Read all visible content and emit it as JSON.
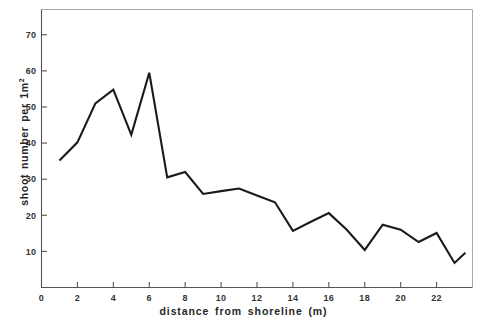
{
  "figure": {
    "background_color": "#ffffff",
    "line_color": "#1a1a1a",
    "axis_color": "#545454",
    "frame_color": "#a9a9a9"
  },
  "chart_data": {
    "type": "line",
    "title": "",
    "subtitle": "",
    "xlabel": "distance from shoreline (m)",
    "ylabel": "shoot number per 1m2",
    "ylabel_base": "shoot number per 1m",
    "ylabel_exponent": "2",
    "xlim": [
      0,
      24
    ],
    "ylim": [
      0,
      77
    ],
    "xticks": [
      0,
      2,
      4,
      6,
      8,
      10,
      12,
      14,
      16,
      18,
      20,
      22
    ],
    "xtick_labels": [
      "0",
      "2",
      "4",
      "6",
      "8",
      "10",
      "12",
      "14",
      "16",
      "18",
      "20",
      "22"
    ],
    "yticks": [
      10,
      20,
      30,
      40,
      50,
      60,
      70
    ],
    "ytick_labels": [
      "10",
      "20",
      "30",
      "40",
      "50",
      "60",
      "70"
    ],
    "grid": false,
    "legend": false,
    "legend_position": "none",
    "x": [
      1,
      2,
      3,
      4,
      5,
      6,
      7,
      8,
      9,
      10,
      11,
      12,
      13,
      14,
      15,
      16,
      17,
      18,
      19,
      20,
      21,
      22,
      23,
      23.6
    ],
    "y": [
      35.2,
      40.2,
      51.0,
      54.8,
      42.3,
      59.5,
      30.5,
      32.0,
      25.9,
      26.7,
      27.4,
      25.5,
      23.6,
      15.7,
      18.2,
      20.6,
      16.0,
      10.4,
      17.4,
      16.0,
      12.6,
      15.1,
      6.8,
      9.6
    ],
    "series": [
      {
        "name": "shoot number",
        "color": "#1a1a1a",
        "values": [
          35.2,
          40.2,
          51.0,
          54.8,
          42.3,
          59.5,
          30.5,
          32.0,
          25.9,
          26.7,
          27.4,
          25.5,
          23.6,
          15.7,
          18.2,
          20.6,
          16.0,
          10.4,
          17.4,
          16.0,
          12.6,
          15.1,
          6.8,
          9.6
        ]
      }
    ]
  }
}
